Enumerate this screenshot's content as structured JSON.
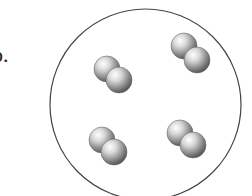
{
  "figure": {
    "label": "b.",
    "container": {
      "shape": "circle",
      "cx": 145.5,
      "cy": 104.5,
      "r": 95.5,
      "stroke": "#444444"
    },
    "molecules": [
      {
        "name": "molecule-top-left",
        "atoms": [
          {
            "cx": 107,
            "cy": 69,
            "r": 13
          },
          {
            "cx": 119,
            "cy": 80,
            "r": 13
          }
        ]
      },
      {
        "name": "molecule-top-right",
        "atoms": [
          {
            "cx": 184,
            "cy": 46,
            "r": 13
          },
          {
            "cx": 197,
            "cy": 60,
            "r": 13
          }
        ]
      },
      {
        "name": "molecule-bottom-left",
        "atoms": [
          {
            "cx": 102,
            "cy": 140,
            "r": 13
          },
          {
            "cx": 114,
            "cy": 152,
            "r": 13
          }
        ]
      },
      {
        "name": "molecule-bottom-right",
        "atoms": [
          {
            "cx": 180,
            "cy": 133,
            "r": 13
          },
          {
            "cx": 193,
            "cy": 145,
            "r": 13
          }
        ]
      }
    ],
    "molecule_count": 4,
    "atoms_per_molecule": 2
  }
}
